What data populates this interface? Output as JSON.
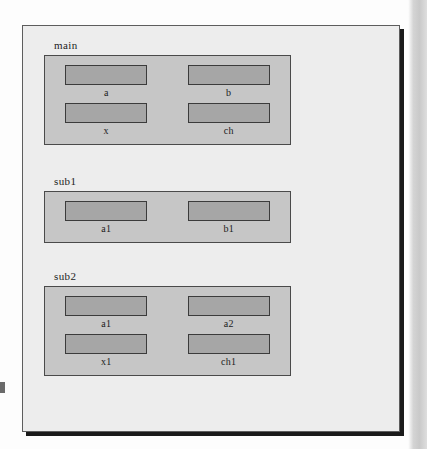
{
  "figure": {
    "background_color": "#ededed",
    "border_color": "#5d5d5d",
    "shadow_color": "#1a1a1a",
    "group_fill_color": "#c6c6c6",
    "node_fill_color": "#a6a6a6",
    "node_border_color": "#3b3b3b",
    "text_color": "#1c1c1c"
  },
  "groups": [
    {
      "label": "main",
      "rows": [
        {
          "nodes": [
            {
              "label": "a"
            },
            {
              "label": "b"
            }
          ]
        },
        {
          "nodes": [
            {
              "label": "x"
            },
            {
              "label": "ch"
            }
          ]
        }
      ]
    },
    {
      "label": "sub1",
      "rows": [
        {
          "nodes": [
            {
              "label": "a1"
            },
            {
              "label": "b1"
            }
          ]
        }
      ]
    },
    {
      "label": "sub2",
      "rows": [
        {
          "nodes": [
            {
              "label": "a1"
            },
            {
              "label": "a2"
            }
          ]
        },
        {
          "nodes": [
            {
              "label": "x1"
            },
            {
              "label": "ch1"
            }
          ]
        }
      ]
    }
  ]
}
